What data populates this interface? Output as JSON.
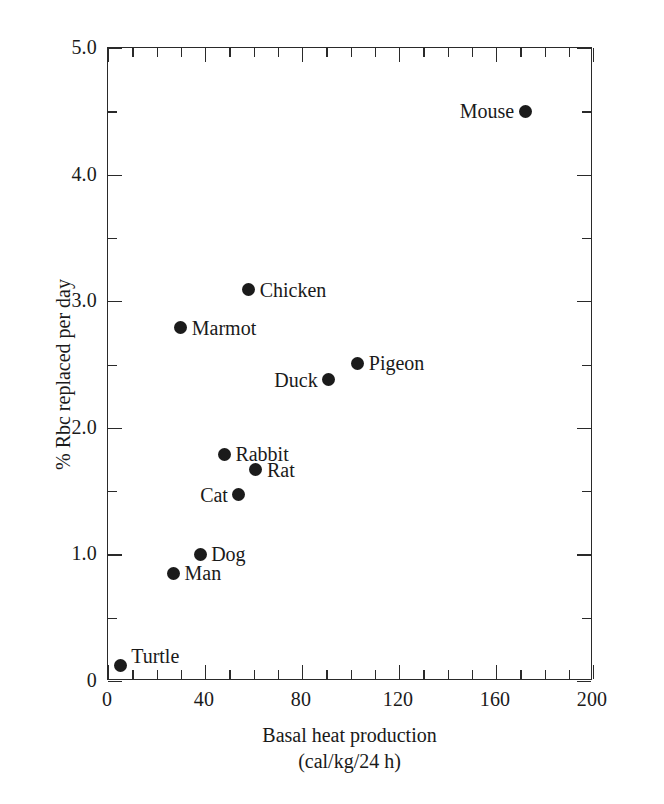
{
  "chart_data": {
    "type": "scatter",
    "title": "",
    "xlabel": "Basal heat production",
    "xlabel_line2": "(cal/kg/24 h)",
    "ylabel": "% Rbc replaced per day",
    "xlim": [
      0,
      200
    ],
    "ylim": [
      0,
      5.0
    ],
    "x_major_ticks": [
      0,
      40,
      80,
      120,
      160,
      200
    ],
    "x_major_tick_labels": [
      "0",
      "40",
      "80",
      "120",
      "160",
      "200"
    ],
    "x_minor_tick_step": 10,
    "y_major_ticks": [
      0,
      1.0,
      2.0,
      3.0,
      4.0,
      5.0
    ],
    "y_major_tick_labels": [
      "0",
      "1.0",
      "2.0",
      "3.0",
      "4.0",
      "5.0"
    ],
    "y_minor_tick_step": 0.5,
    "grid": false,
    "legend": "none",
    "marker": "filled-circle",
    "marker_color": "#1b1b1b",
    "axis_color": "#2a2a2a",
    "points": [
      {
        "label": "Turtle",
        "x": 5,
        "y": 0.12,
        "label_pos": "upright"
      },
      {
        "label": "Man",
        "x": 27,
        "y": 0.85,
        "label_pos": "right"
      },
      {
        "label": "Dog",
        "x": 38,
        "y": 1.0,
        "label_pos": "right"
      },
      {
        "label": "Cat",
        "x": 54,
        "y": 1.47,
        "label_pos": "left"
      },
      {
        "label": "Rabbit",
        "x": 48,
        "y": 1.79,
        "label_pos": "right"
      },
      {
        "label": "Rat",
        "x": 61,
        "y": 1.67,
        "label_pos": "right"
      },
      {
        "label": "Duck",
        "x": 91,
        "y": 2.38,
        "label_pos": "left"
      },
      {
        "label": "Pigeon",
        "x": 103,
        "y": 2.51,
        "label_pos": "right"
      },
      {
        "label": "Marmot",
        "x": 30,
        "y": 2.79,
        "label_pos": "right"
      },
      {
        "label": "Chicken",
        "x": 58,
        "y": 3.09,
        "label_pos": "right"
      },
      {
        "label": "Mouse",
        "x": 172,
        "y": 4.5,
        "label_pos": "left"
      }
    ]
  }
}
